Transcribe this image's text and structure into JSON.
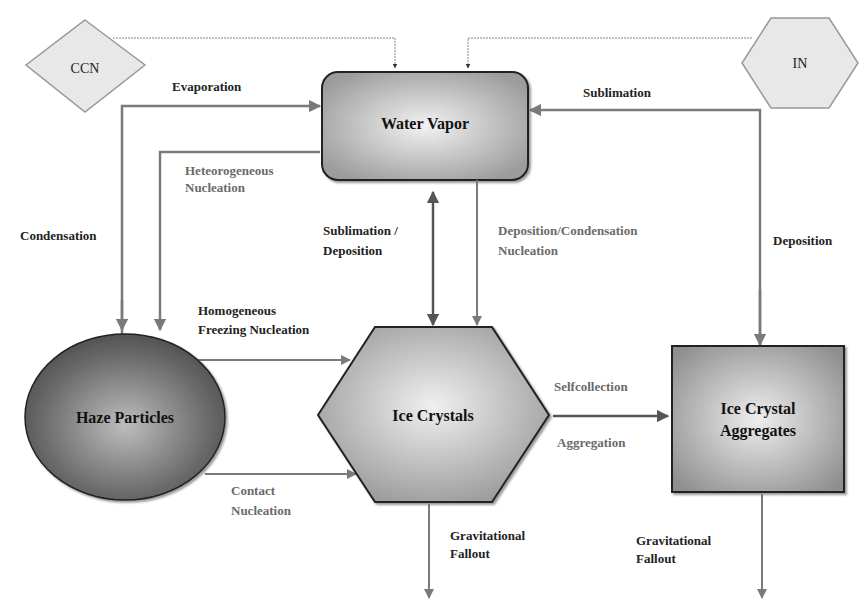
{
  "diagram": {
    "nodes": {
      "ccn": {
        "label": "CCN"
      },
      "in": {
        "label": "IN"
      },
      "water_vapor": {
        "label": "Water Vapor"
      },
      "haze_particles": {
        "label": "Haze Particles"
      },
      "ice_crystals": {
        "label": "Ice Crystals"
      },
      "ice_crystal_aggregates": {
        "line1": "Ice Crystal",
        "line2": "Aggregates"
      }
    },
    "edges": {
      "evaporation": "Evaporation",
      "sublimation_top": "Sublimation",
      "heterogeneous_nucleation": {
        "line1": "Heteorogeneous",
        "line2": "Nucleation"
      },
      "condensation": "Condensation",
      "sublimation_deposition": {
        "line1": "Sublimation /",
        "line2": "Deposition"
      },
      "deposition_condensation_nucleation": {
        "line1": "Deposition/Condensation",
        "line2": "Nucleation"
      },
      "deposition_right": "Deposition",
      "homogeneous_freezing": {
        "line1": "Homogeneous",
        "line2": "Freezing Nucleation"
      },
      "contact_nucleation": {
        "line1": "Contact",
        "line2": "Nucleation"
      },
      "selfcollection": "Selfcollection",
      "aggregation": "Aggregation",
      "gravitational_fallout_ice": {
        "line1": "Gravitational",
        "line2": "Fallout"
      },
      "gravitational_fallout_agg": {
        "line1": "Gravitational",
        "line2": "Fallout"
      }
    },
    "colors": {
      "arrow": "#7a7a7a",
      "arrow_dark": "#555555",
      "node_border": "#222222",
      "source_fill": "#e6e6e6"
    }
  }
}
